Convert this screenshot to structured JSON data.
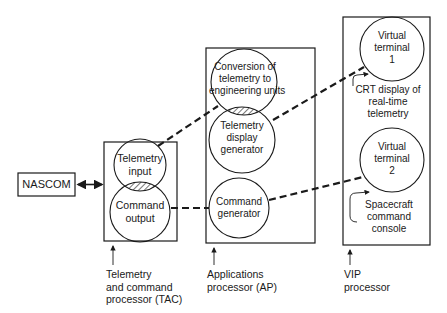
{
  "nascom": {
    "label": "NASCOM"
  },
  "tac": {
    "circles": [
      {
        "lines": [
          "Telemetry",
          "input"
        ]
      },
      {
        "lines": [
          "Command",
          "output"
        ]
      }
    ],
    "caption": [
      "Telemetry",
      "and command",
      "processor (TAC)"
    ]
  },
  "ap": {
    "circles": [
      {
        "lines": [
          "Conversion of",
          "telemetry to",
          "engineering units"
        ]
      },
      {
        "lines": [
          "Telemetry",
          "display",
          "generator"
        ]
      },
      {
        "lines": [
          "Command",
          "generator"
        ]
      }
    ],
    "caption": [
      "Applications",
      "processor (AP)"
    ]
  },
  "vip": {
    "circles": [
      {
        "lines": [
          "Virtual",
          "terminal",
          "1"
        ]
      },
      {
        "lines": [
          "Virtual",
          "terminal",
          "2"
        ]
      }
    ],
    "notes": [
      {
        "lines": [
          "CRT display of",
          "real-time",
          "telemetry"
        ]
      },
      {
        "lines": [
          "Spacecraft",
          "command",
          "console"
        ]
      }
    ],
    "caption": [
      "VIP",
      "processor"
    ]
  },
  "colors": {
    "stroke": "#1a1a1a",
    "background": "#ffffff"
  }
}
